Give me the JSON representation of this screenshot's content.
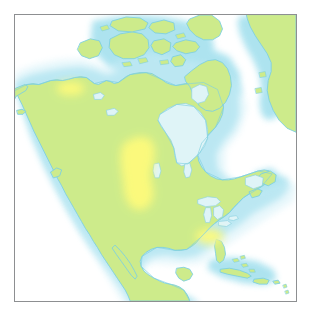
{
  "figure": {
    "kind": "thematic-distribution-map",
    "region": "North America",
    "frame": {
      "border_color": "#8d8f91",
      "border_width_px": 1,
      "x": 14,
      "y": 14,
      "width": 283,
      "height": 288
    },
    "page_background": "#ffffff"
  },
  "palette": {
    "land_fill": "#cdeb8b",
    "land_stroke": "#7fd0e0",
    "highlight_fill": "#fdfa7c",
    "ocean_fill": "#ffffff",
    "coastal_halo_outer": "#e8f8fa",
    "coastal_halo_mid": "#d3f0f5",
    "coastal_halo_inner": "#bde8f0",
    "inland_water_fill": "#dff4f7",
    "inland_water_stroke": "#8fd4e2",
    "frame_stroke": "#8d8f91"
  },
  "layers": [
    {
      "id": "ocean",
      "name": "Ocean",
      "fill": "#ffffff",
      "visible": true
    },
    {
      "id": "coastal-halo",
      "name": "Coastal shelf halo",
      "fill": "#d3f0f5",
      "visible": true
    },
    {
      "id": "land",
      "name": "Landmass",
      "fill": "#cdeb8b",
      "visible": true
    },
    {
      "id": "inland-water",
      "name": "Inland water bodies",
      "fill": "#dff4f7",
      "visible": true
    },
    {
      "id": "highlight",
      "name": "Distribution range",
      "fill": "#fdfa7c",
      "visible": true
    }
  ],
  "landmasses": [
    {
      "name": "North American mainland",
      "id": "mainland"
    },
    {
      "name": "Alaska",
      "id": "alaska"
    },
    {
      "name": "Greenland (west coast)",
      "id": "greenland"
    },
    {
      "name": "Baffin Island",
      "id": "baffin"
    },
    {
      "name": "Victoria Island",
      "id": "victoria"
    },
    {
      "name": "Banks Island",
      "id": "banks"
    },
    {
      "name": "Ellesmere Island",
      "id": "ellesmere"
    },
    {
      "name": "Devon Island",
      "id": "devon"
    },
    {
      "name": "Newfoundland",
      "id": "newfoundland"
    },
    {
      "name": "Nova Scotia",
      "id": "nova-scotia"
    },
    {
      "name": "Yucatan Peninsula",
      "id": "yucatan"
    },
    {
      "name": "Baja California",
      "id": "baja"
    },
    {
      "name": "Cuba",
      "id": "cuba"
    },
    {
      "name": "Hispaniola",
      "id": "hispaniola"
    },
    {
      "name": "Bahamas",
      "id": "bahamas"
    },
    {
      "name": "Vancouver Island",
      "id": "vancouver-island"
    }
  ],
  "water_bodies": [
    {
      "name": "Hudson Bay",
      "id": "hudson-bay"
    },
    {
      "name": "Great Lakes",
      "id": "great-lakes"
    },
    {
      "name": "Great Bear Lake",
      "id": "great-bear-lake"
    },
    {
      "name": "Great Slave Lake",
      "id": "great-slave-lake"
    },
    {
      "name": "Lake Winnipeg",
      "id": "lake-winnipeg"
    },
    {
      "name": "Gulf of Mexico",
      "id": "gulf-of-mexico"
    },
    {
      "name": "Gulf of St. Lawrence",
      "id": "gulf-st-lawrence"
    },
    {
      "name": "Foxe Basin",
      "id": "foxe-basin"
    }
  ],
  "highlight_patches": [
    {
      "id": "patch-yukon",
      "name": "Northwest boreal patch",
      "approx_region": "Yukon / NW Territories"
    },
    {
      "id": "patch-great-plains",
      "name": "Great Plains patch",
      "approx_region": "Central plains, USA / Canada"
    },
    {
      "id": "patch-southeast",
      "name": "Southeast patch",
      "approx_region": "Southeastern United States"
    }
  ],
  "labels": {
    "title": "",
    "legend": "",
    "caption": "",
    "scale": "",
    "attribution": ""
  }
}
